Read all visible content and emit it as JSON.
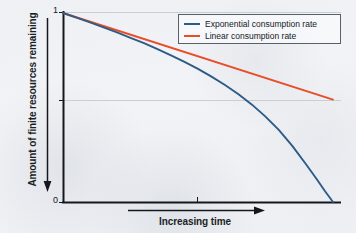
{
  "chart_data": {
    "type": "line",
    "title": "",
    "xlabel": "Increasing time",
    "ylabel": "Amount of finite resources remaining",
    "xlim": [
      0,
      1
    ],
    "ylim": [
      0,
      1
    ],
    "grid": true,
    "grid_lines_y": [
      0.5,
      1.0
    ],
    "legend_position": "upper right",
    "y_tick_labels": [
      "1",
      "0"
    ],
    "y_tick_values": [
      1,
      0
    ],
    "x_tick_labels": [],
    "x_tick_values": [
      0.5
    ],
    "series": [
      {
        "name": "Exponential consumption rate",
        "color": "#2d5b86",
        "x": [
          0.0,
          0.05,
          0.1,
          0.15,
          0.2,
          0.25,
          0.3,
          0.35,
          0.4,
          0.45,
          0.5,
          0.55,
          0.6,
          0.65,
          0.7,
          0.75,
          0.8,
          0.85,
          0.9,
          0.94,
          0.97,
          1.0
        ],
        "values": [
          1.0,
          0.975,
          0.95,
          0.924,
          0.897,
          0.869,
          0.84,
          0.809,
          0.776,
          0.741,
          0.704,
          0.663,
          0.619,
          0.57,
          0.515,
          0.452,
          0.38,
          0.296,
          0.2,
          0.12,
          0.058,
          0.0
        ]
      },
      {
        "name": "Linear consumption rate",
        "color": "#e74d28",
        "x": [
          0.0,
          1.0
        ],
        "values": [
          1.0,
          0.542
        ]
      }
    ],
    "annotations": [
      {
        "name": "y-axis-direction-arrow",
        "text": "",
        "direction": "down"
      },
      {
        "name": "x-axis-direction-arrow",
        "text": "",
        "direction": "right"
      }
    ]
  },
  "axes": {
    "y_title": "Amount of finite resources remaining",
    "x_title": "Increasing time",
    "y_tick_top_label": "1",
    "y_tick_bottom_label": "0"
  },
  "legend": {
    "items": [
      {
        "label": "Exponential consumption rate",
        "color": "#2d5b86"
      },
      {
        "label": "Linear consumption rate",
        "color": "#e74d28"
      }
    ]
  },
  "colors": {
    "exponential": "#2d5b86",
    "linear": "#e74d28",
    "axis": "#14181d",
    "grid": "#c9ced6",
    "background": "#eef1f5"
  }
}
